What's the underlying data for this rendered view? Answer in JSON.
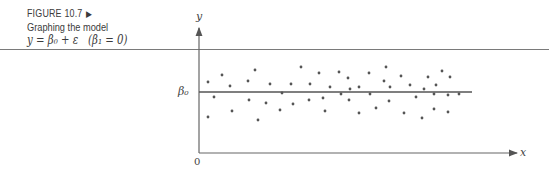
{
  "caption": {
    "figure_label": "FIGURE 10.7",
    "figure_arrow": "▶",
    "title": "Graphing the model",
    "equation": "y = β₀ + ε   (β₁ = 0)"
  },
  "axes": {
    "x_label": "x",
    "y_label": "y",
    "origin_label": "0",
    "intercept_label": "β₀"
  },
  "chart_data": {
    "type": "scatter",
    "xlabel": "x",
    "ylabel": "y",
    "annotations": [
      "β0 (horizontal line at intercept)",
      "0 (origin)"
    ],
    "grid": false,
    "legend": null,
    "reference_line": {
      "type": "horizontal",
      "y": "β0",
      "slope": 0
    },
    "note": "Points scattered randomly above and below the horizontal line y = β0; pixel coordinates (x right, y down) within the plot area",
    "points_px": [
      [
        208,
        82
      ],
      [
        222,
        75
      ],
      [
        230,
        86
      ],
      [
        255,
        70
      ],
      [
        248,
        81
      ],
      [
        270,
        84
      ],
      [
        282,
        93
      ],
      [
        214,
        97
      ],
      [
        249,
        100
      ],
      [
        266,
        103
      ],
      [
        232,
        111
      ],
      [
        280,
        110
      ],
      [
        208,
        117
      ],
      [
        258,
        120
      ],
      [
        301,
        67
      ],
      [
        319,
        73
      ],
      [
        339,
        72
      ],
      [
        348,
        78
      ],
      [
        369,
        73
      ],
      [
        291,
        84
      ],
      [
        310,
        84
      ],
      [
        330,
        87
      ],
      [
        350,
        89
      ],
      [
        359,
        87
      ],
      [
        341,
        94
      ],
      [
        293,
        104
      ],
      [
        309,
        100
      ],
      [
        323,
        98
      ],
      [
        349,
        100
      ],
      [
        325,
        111
      ],
      [
        359,
        113
      ],
      [
        386,
        67
      ],
      [
        401,
        76
      ],
      [
        384,
        81
      ],
      [
        390,
        87
      ],
      [
        410,
        85
      ],
      [
        424,
        89
      ],
      [
        428,
        77
      ],
      [
        436,
        85
      ],
      [
        442,
        71
      ],
      [
        450,
        77
      ],
      [
        370,
        94
      ],
      [
        416,
        97
      ],
      [
        434,
        94
      ],
      [
        448,
        95
      ],
      [
        389,
        101
      ],
      [
        376,
        108
      ],
      [
        404,
        113
      ],
      [
        434,
        109
      ],
      [
        422,
        118
      ],
      [
        448,
        112
      ],
      [
        459,
        94
      ]
    ]
  }
}
